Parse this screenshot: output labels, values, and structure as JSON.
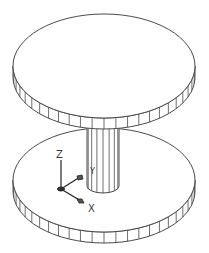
{
  "drawing": {
    "type": "isometric-cad-model",
    "description": "Two circular disks connected by a central cylindrical shaft",
    "colors": {
      "background": "#ffffff",
      "line": "#4a4a4a",
      "axis": "#222222"
    },
    "top_disk": {
      "cx": 104,
      "cy": 66,
      "rx": 91,
      "ry": 52,
      "thickness": 11,
      "segments": 24
    },
    "bottom_disk": {
      "cx": 104,
      "cy": 180,
      "rx": 91,
      "ry": 52,
      "thickness": 11,
      "segments": 24
    },
    "shaft": {
      "cx": 103,
      "top": 120,
      "bottom": 186,
      "rx": 16,
      "ry": 7
    }
  },
  "ucs_icon": {
    "z_label": "Z",
    "y_label": "Y",
    "x_label": "X"
  }
}
